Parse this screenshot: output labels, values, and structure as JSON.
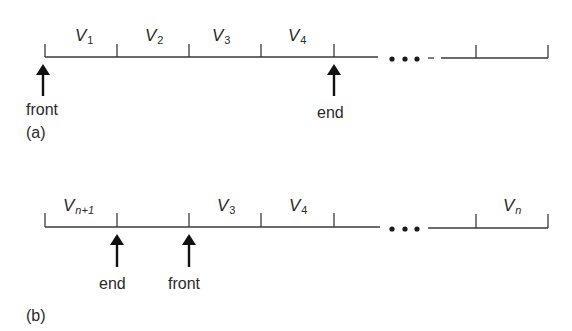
{
  "diagram": {
    "type": "circular-queue-array",
    "panels": [
      {
        "id": "a",
        "caption": "(a)",
        "cells": [
          {
            "main": "V",
            "sub": "1"
          },
          {
            "main": "V",
            "sub": "2"
          },
          {
            "main": "V",
            "sub": "3"
          },
          {
            "main": "V",
            "sub": "4"
          },
          {
            "main": "",
            "sub": ""
          },
          {
            "main": "",
            "sub": ""
          },
          {
            "main": "",
            "sub": ""
          }
        ],
        "ellipsis": "• • •",
        "pointers": [
          {
            "label": "front",
            "position": "cell-1-left"
          },
          {
            "label": "end",
            "position": "after-cell-4"
          }
        ]
      },
      {
        "id": "b",
        "caption": "(b)",
        "cells": [
          {
            "main": "V",
            "sub": "n+1"
          },
          {
            "main": "",
            "sub": ""
          },
          {
            "main": "V",
            "sub": "3"
          },
          {
            "main": "V",
            "sub": "4"
          },
          {
            "main": "",
            "sub": ""
          },
          {
            "main": "V",
            "sub": "n"
          }
        ],
        "ellipsis": "• • •",
        "pointers": [
          {
            "label": "end",
            "position": "after-cell-1"
          },
          {
            "label": "front",
            "position": "after-cell-2"
          }
        ]
      }
    ]
  },
  "a": {
    "caption": "(a)",
    "v1": "V",
    "v1_sub": "1",
    "v2": "V",
    "v2_sub": "2",
    "v3": "V",
    "v3_sub": "3",
    "v4": "V",
    "v4_sub": "4",
    "front": "front",
    "end": "end"
  },
  "b": {
    "caption": "(b)",
    "vn1": "V",
    "vn1_sub": "n+1",
    "v3": "V",
    "v3_sub": "3",
    "v4": "V",
    "v4_sub": "4",
    "vn": "V",
    "vn_sub": "n",
    "front": "front",
    "end": "end"
  }
}
